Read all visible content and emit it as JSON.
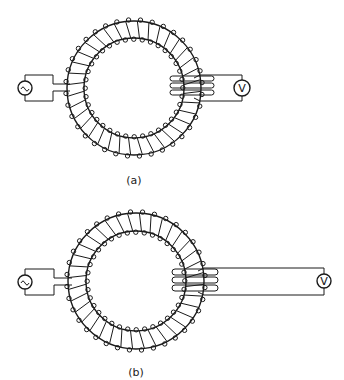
{
  "figure": {
    "width": 344,
    "height": 380,
    "line_color": "#1a1a1a",
    "panels": [
      {
        "id": "a",
        "label": "(a)",
        "label_pos": [
          134,
          184
        ],
        "toroid": {
          "cx": 134,
          "cy": 88,
          "r_outer": 67,
          "r_inner": 50,
          "turns": 36
        },
        "source": {
          "symbol": "~",
          "cx": 25,
          "cy": 88,
          "r": 7,
          "rect": [
            25,
            75,
            53,
            101
          ],
          "leads": [
            [
              53,
              84,
              70,
              84
            ],
            [
              53,
              91,
              70,
              91
            ]
          ]
        },
        "secondary": {
          "x1": 170,
          "x2": 214,
          "loops_y": [
            75,
            82,
            89,
            96
          ],
          "lead_top": [
            200,
            75
          ],
          "lead_bottom": [
            200,
            101
          ]
        },
        "meter": {
          "symbol": "V",
          "cx": 242,
          "cy": 88,
          "r": 8,
          "rect_right": 242
        }
      },
      {
        "id": "b",
        "label": "(b)",
        "label_pos": [
          136,
          376
        ],
        "toroid": {
          "cx": 136,
          "cy": 281,
          "r_outer": 68,
          "r_inner": 50,
          "turns": 36
        },
        "source": {
          "symbol": "~",
          "cx": 25,
          "cy": 282,
          "r": 7,
          "rect": [
            25,
            269,
            54,
            295
          ],
          "leads": [
            [
              54,
              278,
              72,
              278
            ],
            [
              54,
              285,
              72,
              285
            ]
          ]
        },
        "secondary": {
          "x1": 172,
          "x2": 218,
          "loops_y": [
            268,
            276,
            284,
            292
          ],
          "lead_top": [
            204,
            268
          ],
          "lead_bottom": [
            204,
            295
          ]
        },
        "meter": {
          "symbol": "V",
          "cx": 324,
          "cy": 281,
          "r": 7,
          "rect_right": 324
        }
      }
    ]
  }
}
